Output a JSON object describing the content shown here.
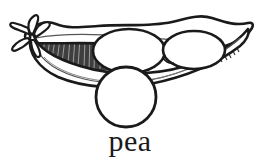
{
  "figure": {
    "caption": "pea",
    "style": "black-and-white line drawing",
    "background_color": "#ffffff",
    "ink_color": "#1a1a1a",
    "shading_color": "#3a3a3a",
    "parts": [
      {
        "name": "stem-calyx",
        "label": "stem and calyx"
      },
      {
        "name": "pod-upper-valve",
        "label": "upper pod valve"
      },
      {
        "name": "pod-lower-valve",
        "label": "lower pod valve"
      },
      {
        "name": "pod-interior-hatching",
        "label": "interior shading hatch"
      },
      {
        "name": "pea-in-pod-left",
        "label": "pea in pod (left)"
      },
      {
        "name": "pea-in-pod-right",
        "label": "pea in pod (right)"
      },
      {
        "name": "loose-pea",
        "label": "single loose pea"
      }
    ]
  }
}
